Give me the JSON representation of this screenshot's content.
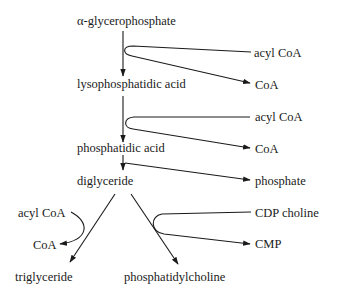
{
  "diagram": {
    "type": "metabolic-pathway",
    "nodes": {
      "glycerophosphate": "α-glycerophosphate",
      "lysophosphatidic_acid": "lysophosphatidic acid",
      "phosphatidic_acid": "phosphatidic acid",
      "diglyceride": "diglyceride",
      "triglyceride": "triglyceride",
      "phosphatidylcholine": "phosphatidylcholine"
    },
    "side_inputs_outputs": {
      "step1_in": "acyl CoA",
      "step1_out": "CoA",
      "step2_in": "acyl CoA",
      "step2_out": "CoA",
      "step3_out": "phosphate",
      "step4_in": "acyl CoA",
      "step4_out": "CoA",
      "step5_in": "CDP choline",
      "step5_out": "CMP"
    },
    "edges": [
      {
        "from": "α-glycerophosphate",
        "to": "lysophosphatidic acid",
        "cofactor_in": "acyl CoA",
        "cofactor_out": "CoA"
      },
      {
        "from": "lysophosphatidic acid",
        "to": "phosphatidic acid",
        "cofactor_in": "acyl CoA",
        "cofactor_out": "CoA"
      },
      {
        "from": "phosphatidic acid",
        "to": "diglyceride",
        "cofactor_out": "phosphate"
      },
      {
        "from": "diglyceride",
        "to": "triglyceride",
        "cofactor_in": "acyl CoA",
        "cofactor_out": "CoA"
      },
      {
        "from": "diglyceride",
        "to": "phosphatidylcholine",
        "cofactor_in": "CDP choline",
        "cofactor_out": "CMP"
      }
    ]
  }
}
